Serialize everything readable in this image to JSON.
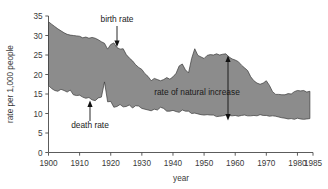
{
  "chart_data": {
    "type": "area",
    "title": "",
    "subtitle": "",
    "xlabel": "year",
    "ylabel": "rate per 1,000 people",
    "xlim": [
      1900,
      1985
    ],
    "ylim": [
      0,
      35
    ],
    "xticks": [
      1900,
      1910,
      1920,
      1930,
      1940,
      1950,
      1960,
      1970,
      1980,
      1985
    ],
    "yticks": [
      0,
      5,
      10,
      15,
      20,
      25,
      30,
      35
    ],
    "grid": false,
    "legend_position": "none",
    "fill_color": "#8c8c8c",
    "line_color": "#3a3a3a",
    "axis_color": "#4a4a4a",
    "x": [
      1900,
      1901,
      1902,
      1903,
      1904,
      1905,
      1906,
      1907,
      1908,
      1909,
      1910,
      1911,
      1912,
      1913,
      1914,
      1915,
      1916,
      1917,
      1918,
      1919,
      1920,
      1921,
      1922,
      1923,
      1924,
      1925,
      1926,
      1927,
      1928,
      1929,
      1930,
      1931,
      1932,
      1933,
      1934,
      1935,
      1936,
      1937,
      1938,
      1939,
      1940,
      1941,
      1942,
      1943,
      1944,
      1945,
      1946,
      1947,
      1948,
      1949,
      1950,
      1951,
      1952,
      1953,
      1954,
      1955,
      1956,
      1957,
      1958,
      1959,
      1960,
      1961,
      1962,
      1963,
      1964,
      1965,
      1966,
      1967,
      1968,
      1969,
      1970,
      1971,
      1972,
      1973,
      1974,
      1975,
      1976,
      1977,
      1978,
      1979,
      1980,
      1981,
      1982,
      1983,
      1984
    ],
    "series": [
      {
        "name": "birth rate",
        "values": [
          33.5,
          32.9,
          32.3,
          31.7,
          31.2,
          30.7,
          30.3,
          30.1,
          30.0,
          29.9,
          29.8,
          29.4,
          29.6,
          29.3,
          29.5,
          29.3,
          28.9,
          28.4,
          28.0,
          26.5,
          27.7,
          28.1,
          26.9,
          26.5,
          26.6,
          25.1,
          24.2,
          23.5,
          22.5,
          21.8,
          21.3,
          20.2,
          19.5,
          18.4,
          19.0,
          18.7,
          18.4,
          18.7,
          19.2,
          18.8,
          19.4,
          20.3,
          22.2,
          22.7,
          21.2,
          20.4,
          24.1,
          26.6,
          24.9,
          24.5,
          24.1,
          24.9,
          25.1,
          25.0,
          25.3,
          25.0,
          25.2,
          25.3,
          24.5,
          24.0,
          23.7,
          23.3,
          22.4,
          21.7,
          21.0,
          19.4,
          18.4,
          17.8,
          17.5,
          17.8,
          18.4,
          17.2,
          15.6,
          14.9,
          14.9,
          14.8,
          14.8,
          15.1,
          15.0,
          15.6,
          15.9,
          15.8,
          15.9,
          15.5,
          15.7
        ]
      },
      {
        "name": "death rate",
        "values": [
          17.2,
          16.4,
          15.9,
          15.7,
          16.2,
          15.9,
          15.5,
          16.0,
          14.8,
          14.6,
          14.7,
          14.2,
          13.9,
          14.1,
          13.5,
          13.3,
          14.0,
          14.2,
          18.1,
          13.0,
          13.1,
          11.6,
          11.8,
          12.3,
          11.7,
          11.8,
          12.2,
          11.4,
          12.0,
          11.9,
          11.3,
          11.1,
          10.9,
          10.7,
          11.1,
          10.9,
          11.6,
          11.3,
          10.6,
          10.6,
          10.8,
          10.5,
          10.3,
          10.9,
          10.6,
          10.6,
          10.0,
          10.1,
          9.9,
          9.7,
          9.6,
          9.7,
          9.6,
          9.6,
          9.2,
          9.3,
          9.4,
          9.6,
          9.5,
          9.4,
          9.5,
          9.3,
          9.5,
          9.6,
          9.4,
          9.4,
          9.5,
          9.4,
          9.7,
          9.5,
          9.5,
          9.3,
          9.4,
          9.3,
          9.1,
          8.9,
          8.8,
          8.6,
          8.7,
          8.5,
          8.8,
          8.6,
          8.5,
          8.6,
          8.7
        ]
      }
    ],
    "annotations": [
      {
        "id": "birth-rate",
        "text": "birth rate",
        "arrow": "down",
        "target_year": 1923,
        "target_value": 26.9
      },
      {
        "id": "death-rate",
        "text": "death rate",
        "arrow": "up",
        "target_year": 1916,
        "target_value": 14.0
      },
      {
        "id": "rate-of-natural-increase",
        "text": "rate of natural increase",
        "arrow": "double-vertical",
        "target_year": 1958,
        "target_value_top": 24.5,
        "target_value_bottom": 9.5
      }
    ]
  },
  "axes": {
    "y_axis_title": "rate per 1,000 people",
    "x_axis_title": "year",
    "y_tick_labels": [
      "0",
      "5",
      "10",
      "15",
      "20",
      "25",
      "30",
      "35"
    ],
    "x_tick_labels": [
      "1900",
      "1910",
      "1920",
      "1930",
      "1940",
      "1950",
      "1960",
      "1970",
      "1980",
      "1985"
    ]
  },
  "annotation_labels": {
    "birth_rate": "birth rate",
    "death_rate": "death rate",
    "natural_increase": "rate of natural increase"
  }
}
